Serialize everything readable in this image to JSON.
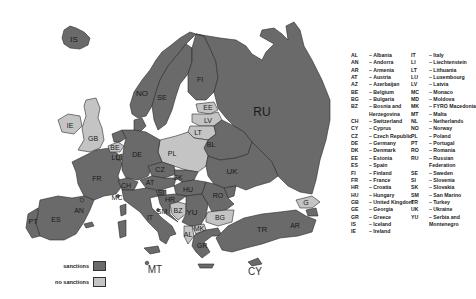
{
  "map": {
    "type": "choropleth",
    "region": "Europe",
    "colors": {
      "sanctions": "#6a6a6a",
      "no_sanctions": "#c4c4c4",
      "water": "#ffffff",
      "border": "#2a2a2a"
    },
    "labels": {
      "IS": "IS",
      "NO": "NO",
      "SE": "SE",
      "FI": "FI",
      "RU": "RU",
      "EE": "EE",
      "LV": "LV",
      "LT": "LT",
      "BL": "BL",
      "PL": "PL",
      "UK": "UK",
      "IE": "IE",
      "GB": "GB",
      "FR": "FR",
      "ES": "ES",
      "PT": "PT",
      "AN": "AN",
      "BE": "BE",
      "LU": "LU",
      "DE": "DE",
      "CZ": "CZ",
      "SK": "SK",
      "AT": "AT",
      "CH": "CH",
      "HU": "HU",
      "SI": "SI",
      "HR": "HR",
      "BZ": "BZ",
      "YU": "YU",
      "RO": "RO",
      "BG": "BG",
      "MK": "MK",
      "AL": "AL",
      "GR": "GR",
      "IT": "IT",
      "SM": "SM",
      "MC": "MC",
      "MT": "MT",
      "TR": "TR",
      "GE": "G",
      "AR": "AR",
      "CY": "CY",
      "MD": "MD",
      "NL": "NL",
      "DK": "DK"
    },
    "status": {
      "sanctions": [
        "IS",
        "NO",
        "SE",
        "FI",
        "RU",
        "BL",
        "UK",
        "FR",
        "ES",
        "PT",
        "AN",
        "DE",
        "CZ",
        "SK",
        "AT",
        "CH",
        "HU",
        "SI",
        "HR",
        "YU",
        "RO",
        "GR",
        "IT",
        "SM",
        "MC",
        "TR",
        "AR",
        "MD",
        "NL",
        "DK",
        "LU",
        "CY",
        "MT"
      ],
      "no_sanctions": [
        "PL",
        "LT",
        "LV",
        "EE",
        "GB",
        "IE",
        "BG",
        "MK",
        "BZ",
        "GE",
        "AL",
        "BE"
      ]
    }
  },
  "key": {
    "col1": [
      {
        "code": "AL",
        "name": "– Albania"
      },
      {
        "code": "AN",
        "name": "– Andorra"
      },
      {
        "code": "AR",
        "name": "– Armenia"
      },
      {
        "code": "AT",
        "name": "– Austria"
      },
      {
        "code": "AZ",
        "name": "– Azerbaijan"
      },
      {
        "code": "BE",
        "name": "– Belgium"
      },
      {
        "code": "BG",
        "name": "– Bulgaria"
      },
      {
        "code": "BZ",
        "name": "– Bosnia and",
        "cont": "Herzegovina"
      },
      {
        "code": "CH",
        "name": "– Switzerland"
      },
      {
        "code": "CY",
        "name": "– Cyprus"
      },
      {
        "code": "CZ",
        "name": "– Czech Republic"
      },
      {
        "code": "DE",
        "name": "– Germany"
      },
      {
        "code": "DK",
        "name": "– Denmark"
      },
      {
        "code": "EE",
        "name": "– Estonia"
      },
      {
        "code": "ES",
        "name": "– Spain"
      },
      {
        "code": "FI",
        "name": "– Finland"
      },
      {
        "code": "FR",
        "name": "– France"
      },
      {
        "code": "HR",
        "name": "– Croatia"
      },
      {
        "code": "HU",
        "name": "– Hungary"
      },
      {
        "code": "GB",
        "name": "– United Kingdom"
      },
      {
        "code": "GE",
        "name": "– Georgia"
      },
      {
        "code": "GR",
        "name": "– Greece"
      },
      {
        "code": "IS",
        "name": "– Iceland"
      },
      {
        "code": "IE",
        "name": "– Ireland"
      }
    ],
    "col2": [
      {
        "code": "IT",
        "name": "– Italy"
      },
      {
        "code": "LI",
        "name": "– Liechtenstein"
      },
      {
        "code": "LT",
        "name": "– Lithuania"
      },
      {
        "code": "LU",
        "name": "– Luxembourg"
      },
      {
        "code": "LV",
        "name": "– Latvia"
      },
      {
        "code": "MC",
        "name": "– Monaco"
      },
      {
        "code": "MD",
        "name": "– Moldova"
      },
      {
        "code": "MK",
        "name": "– FYRO Macedonia"
      },
      {
        "code": "MT",
        "name": "– Malta"
      },
      {
        "code": "NL",
        "name": "– Netherlands"
      },
      {
        "code": "NO",
        "name": "– Norway"
      },
      {
        "code": "PL",
        "name": "– Poland"
      },
      {
        "code": "PT",
        "name": "– Portugal"
      },
      {
        "code": "RO",
        "name": "– Romania"
      },
      {
        "code": "RU",
        "name": "– Russian",
        "cont": "Federation"
      },
      {
        "code": "SE",
        "name": "– Sweden"
      },
      {
        "code": "SI",
        "name": "– Slovenia"
      },
      {
        "code": "SK",
        "name": "– Slovakia"
      },
      {
        "code": "SM",
        "name": "– San Marino"
      },
      {
        "code": "TR",
        "name": "– Turkey"
      },
      {
        "code": "UK",
        "name": "– Ukraine"
      },
      {
        "code": "YU",
        "name": "– Serbia and",
        "cont": "Montenegro"
      }
    ]
  },
  "legend": {
    "sanctions_label": "sanctions",
    "no_sanctions_label": "no sanctions"
  }
}
